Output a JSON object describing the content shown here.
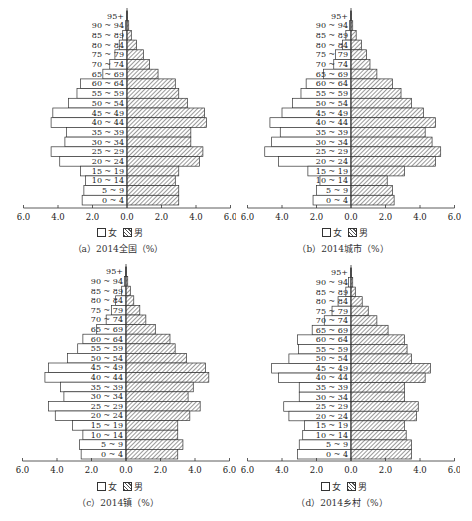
{
  "legend": {
    "female": "女",
    "male": "男"
  },
  "axis_ticks": [
    "6.0",
    "4.0",
    "2.0",
    "0.0",
    "2.0",
    "4.0",
    "6.0"
  ],
  "age_groups": [
    "95+",
    "90 ~ 94",
    "85 ~ 89",
    "80 ~ 84",
    "75 ~ 79",
    "70 ~ 74",
    "65 ~ 69",
    "60 ~ 64",
    "55 ~ 59",
    "50 ~ 54",
    "45 ~ 49",
    "40 ~ 44",
    "35 ~ 39",
    "30 ~ 34",
    "25 ~ 29",
    "20 ~ 24",
    "15 ~ 19",
    "10 ~ 14",
    "5 ~ 9",
    "0 ~ 4"
  ],
  "panels": [
    {
      "caption": "（a）2014全国（%）"
    },
    {
      "caption": "（b）2014城市（%）"
    },
    {
      "caption": "（c）2014镇（%）"
    },
    {
      "caption": "（d）2014乡村（%）"
    }
  ],
  "chart_data": [
    {
      "type": "bar",
      "orientation": "horizontal-population-pyramid",
      "title": "（a）2014全国（%）",
      "xlabel": "%",
      "xlim": [
        -6.0,
        6.0
      ],
      "categories": [
        "95+",
        "90-94",
        "85-89",
        "80-84",
        "75-79",
        "70-74",
        "65-69",
        "60-64",
        "55-59",
        "50-54",
        "45-49",
        "40-44",
        "35-39",
        "30-34",
        "25-29",
        "20-24",
        "15-19",
        "10-14",
        "5-9",
        "0-4"
      ],
      "series": [
        {
          "name": "女",
          "values": [
            0.02,
            0.08,
            0.25,
            0.45,
            0.7,
            1.0,
            1.4,
            2.7,
            2.9,
            3.4,
            4.3,
            4.4,
            3.5,
            3.6,
            4.4,
            3.9,
            2.7,
            2.4,
            2.5,
            2.6
          ]
        },
        {
          "name": "男",
          "values": [
            0.02,
            0.1,
            0.25,
            0.55,
            0.95,
            1.3,
            1.8,
            2.8,
            3.0,
            3.5,
            4.5,
            4.6,
            3.7,
            3.7,
            4.4,
            4.2,
            3.0,
            2.8,
            3.0,
            3.0
          ]
        }
      ],
      "legend_position": "bottom"
    },
    {
      "type": "bar",
      "orientation": "horizontal-population-pyramid",
      "title": "（b）2014城市（%）",
      "xlabel": "%",
      "xlim": [
        -6.0,
        6.0
      ],
      "categories": [
        "95+",
        "90-94",
        "85-89",
        "80-84",
        "75-79",
        "70-74",
        "65-69",
        "60-64",
        "55-59",
        "50-54",
        "45-49",
        "40-44",
        "35-39",
        "30-34",
        "25-29",
        "20-24",
        "15-19",
        "10-14",
        "5-9",
        "0-4"
      ],
      "series": [
        {
          "name": "女",
          "values": [
            0.02,
            0.08,
            0.3,
            0.5,
            0.9,
            1.0,
            1.6,
            2.6,
            2.9,
            3.4,
            4.0,
            4.7,
            4.1,
            4.6,
            5.0,
            4.2,
            2.5,
            1.8,
            2.0,
            2.2
          ]
        },
        {
          "name": "男",
          "values": [
            0.02,
            0.1,
            0.3,
            0.6,
            0.9,
            1.1,
            1.5,
            2.4,
            2.9,
            3.5,
            4.2,
            4.9,
            4.3,
            4.7,
            5.2,
            4.9,
            3.1,
            2.1,
            2.4,
            2.5
          ]
        }
      ],
      "legend_position": "bottom"
    },
    {
      "type": "bar",
      "orientation": "horizontal-population-pyramid",
      "title": "（c）2014镇（%）",
      "xlabel": "%",
      "xlim": [
        -6.0,
        6.0
      ],
      "categories": [
        "95+",
        "90-94",
        "85-89",
        "80-84",
        "75-79",
        "70-74",
        "65-69",
        "60-64",
        "55-59",
        "50-54",
        "45-49",
        "40-44",
        "35-39",
        "30-34",
        "25-29",
        "20-24",
        "15-19",
        "10-14",
        "5-9",
        "0-4"
      ],
      "series": [
        {
          "name": "女",
          "values": [
            0.02,
            0.08,
            0.25,
            0.6,
            0.85,
            1.15,
            1.7,
            2.5,
            2.8,
            3.4,
            4.5,
            4.7,
            3.8,
            3.6,
            4.5,
            4.1,
            3.1,
            2.5,
            2.7,
            2.6
          ]
        },
        {
          "name": "男",
          "values": [
            0.02,
            0.1,
            0.25,
            0.45,
            0.8,
            1.15,
            1.7,
            2.55,
            2.85,
            3.5,
            4.6,
            4.8,
            3.9,
            3.6,
            4.3,
            3.7,
            3.0,
            3.0,
            3.3,
            3.0
          ]
        }
      ],
      "legend_position": "bottom"
    },
    {
      "type": "bar",
      "orientation": "horizontal-population-pyramid",
      "title": "（d）2014乡村（%）",
      "xlabel": "%",
      "xlim": [
        -6.0,
        6.0
      ],
      "categories": [
        "95+",
        "90-94",
        "85-89",
        "80-84",
        "75-79",
        "70-74",
        "65-69",
        "60-64",
        "55-59",
        "50-54",
        "45-49",
        "40-44",
        "35-39",
        "30-34",
        "25-29",
        "20-24",
        "15-19",
        "10-14",
        "5-9",
        "0-4"
      ],
      "series": [
        {
          "name": "女",
          "values": [
            0.02,
            0.15,
            0.3,
            0.75,
            1.1,
            1.55,
            2.25,
            3.1,
            3.05,
            3.6,
            4.6,
            4.2,
            3.0,
            3.0,
            3.9,
            3.6,
            2.7,
            2.8,
            3.0,
            3.1
          ]
        },
        {
          "name": "男",
          "values": [
            0.02,
            0.1,
            0.25,
            0.65,
            1.0,
            1.5,
            2.15,
            3.1,
            3.25,
            3.5,
            4.6,
            4.3,
            3.1,
            3.1,
            3.9,
            3.8,
            3.1,
            3.2,
            3.5,
            3.5
          ]
        }
      ],
      "legend_position": "bottom"
    }
  ]
}
